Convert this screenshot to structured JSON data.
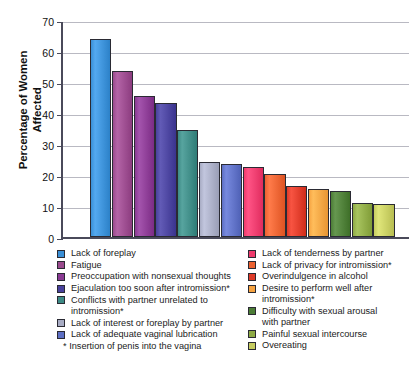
{
  "chart_data": {
    "type": "bar",
    "title": "",
    "xlabel": "",
    "ylabel": "Percentage of Women Affected",
    "ylim": [
      0,
      70
    ],
    "yticks": [
      0,
      10,
      20,
      30,
      40,
      50,
      60,
      70
    ],
    "grid": true,
    "legend_position": "below",
    "footnote": "* Insertion of penis into the vagina",
    "categories": [
      "Lack of foreplay",
      "Fatigue",
      "Preoccupation with nonsexual thoughts",
      "Ejaculation too soon after intromission*",
      "Conflicts with partner unrelated to intromission*",
      "Lack of interest or foreplay by partner",
      "Lack of adequate vaginal lubrication",
      "Lack of tenderness by partner",
      "Lack of privacy for intromission*",
      "Overindulgence in alcohol",
      "Desire to perform well after intromission*",
      "Difficulty with sexual arousal with partner",
      "Painful sexual intercourse",
      "Overeating"
    ],
    "values": [
      63.8,
      53.7,
      45.6,
      43.1,
      34.6,
      24.3,
      23.7,
      22.7,
      20.3,
      16.4,
      15.4,
      14.8,
      11.0,
      10.6
    ],
    "colors": [
      "#3a8fd6",
      "#9a4a8d",
      "#8a3a93",
      "#48419c",
      "#3d8a85",
      "#a8acc4",
      "#5d6fc4",
      "#ee3a6c",
      "#ec6130",
      "#de3a28",
      "#f6a341",
      "#4c7d36",
      "#8eaa45",
      "#c6cc60"
    ]
  },
  "legend": {
    "left_column": [
      {
        "label": "Lack of foreplay",
        "color": "#3a8fd6"
      },
      {
        "label": "Fatigue",
        "color": "#9a4a8d"
      },
      {
        "label": "Preoccupation with nonsexual thoughts",
        "color": "#8a3a93"
      },
      {
        "label": "Ejaculation too soon after intromission*",
        "color": "#48419c"
      },
      {
        "label": "Conflicts with partner unrelated to\n    intromission*",
        "color": "#3d8a85"
      },
      {
        "label": "Lack of interest or foreplay by partner",
        "color": "#a8acc4"
      },
      {
        "label": "Lack of adequate vaginal lubrication",
        "color": "#5d6fc4"
      }
    ],
    "right_column": [
      {
        "label": "Lack of tenderness by partner",
        "color": "#ee3a6c"
      },
      {
        "label": "Lack of privacy for intromission*",
        "color": "#ec6130"
      },
      {
        "label": "Overindulgence in alcohol",
        "color": "#de3a28"
      },
      {
        "label": "Desire to perform well after\n    intromission*",
        "color": "#f6a341"
      },
      {
        "label": "Difficulty with sexual arousal\n    with partner",
        "color": "#4c7d36"
      },
      {
        "label": "Painful sexual intercourse",
        "color": "#8eaa45"
      },
      {
        "label": "Overeating",
        "color": "#c6cc60"
      }
    ]
  },
  "axis": {
    "y_title_line1": "Percentage of Women",
    "y_title_line2": "Affected"
  }
}
